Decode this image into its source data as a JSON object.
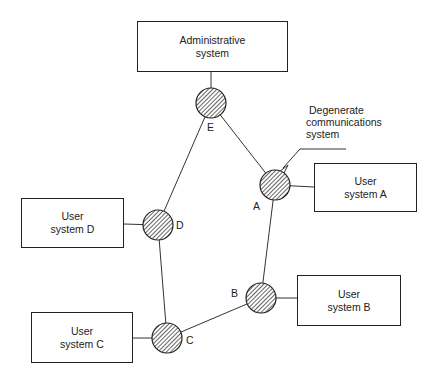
{
  "boxes": {
    "admin": {
      "line1": "Administrative",
      "line2": "system"
    },
    "user_a": {
      "line1": "User",
      "line2": "system A"
    },
    "user_b": {
      "line1": "User",
      "line2": "system B"
    },
    "user_c": {
      "line1": "User",
      "line2": "system C"
    },
    "user_d": {
      "line1": "User",
      "line2": "system D"
    }
  },
  "nodes": {
    "a": "A",
    "b": "B",
    "c": "C",
    "d": "D",
    "e": "E"
  },
  "annotation": {
    "line1": "Degenerate",
    "line2": "communications",
    "line3": "system"
  }
}
